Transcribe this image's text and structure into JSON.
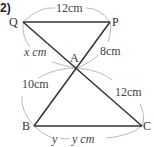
{
  "problem_label": "2)",
  "points": {
    "Q": {
      "label": "Q",
      "x": 23,
      "y": 22
    },
    "P": {
      "label": "P",
      "x": 110,
      "y": 22
    },
    "A": {
      "label": "A",
      "x": 77,
      "y": 68
    },
    "B": {
      "label": "B",
      "x": 34,
      "y": 126
    },
    "C": {
      "label": "C",
      "x": 142,
      "y": 126
    }
  },
  "measurements": {
    "QP": "12cm",
    "QA": "x cm",
    "AP": "8cm",
    "BA": "10cm",
    "AC": "12cm",
    "BC_prefix": "y",
    "BC": "y cm"
  },
  "colors": {
    "line": "#333333",
    "arc": "#aaaaaa",
    "text": "#333333"
  }
}
